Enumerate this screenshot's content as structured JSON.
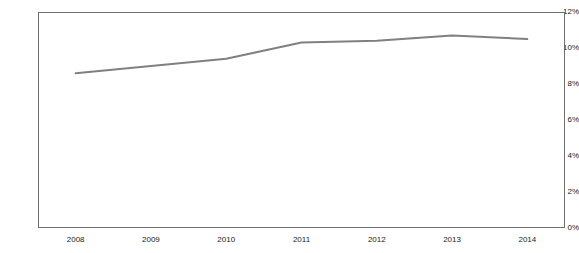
{
  "chart": {
    "title": "",
    "subtitle": "",
    "background_color": "#ffffff",
    "frame_color": "#6f6f6f",
    "line_color": "#808080"
  },
  "chart_data": {
    "type": "line",
    "title": "",
    "xlabel": "",
    "ylabel": "",
    "categories": [
      "2008",
      "2009",
      "2010",
      "2011",
      "2012",
      "2013",
      "2014"
    ],
    "x": [
      2008,
      2009,
      2010,
      2011,
      2012,
      2013,
      2014
    ],
    "values": [
      8.6,
      9.0,
      9.4,
      10.3,
      10.4,
      10.7,
      10.5
    ],
    "series": [
      {
        "name": "",
        "values": [
          8.6,
          9.0,
          9.4,
          10.3,
          10.4,
          10.7,
          10.5
        ],
        "color": "#808080"
      }
    ],
    "ylim": [
      0,
      12
    ],
    "xlim": [
      2008,
      2014
    ],
    "ytick_values": [
      0,
      2,
      4,
      6,
      8,
      10,
      12
    ],
    "ytick_labels": [
      "0%",
      "2%",
      "4%",
      "6%",
      "8%",
      "10%",
      "12%"
    ],
    "xtick_labels": [
      "2008",
      "2009",
      "2010",
      "2011",
      "2012",
      "2013",
      "2014"
    ],
    "grid": false,
    "legend": false,
    "legend_position": "none",
    "markers": false,
    "line_width": 2,
    "value_format": "percent"
  }
}
